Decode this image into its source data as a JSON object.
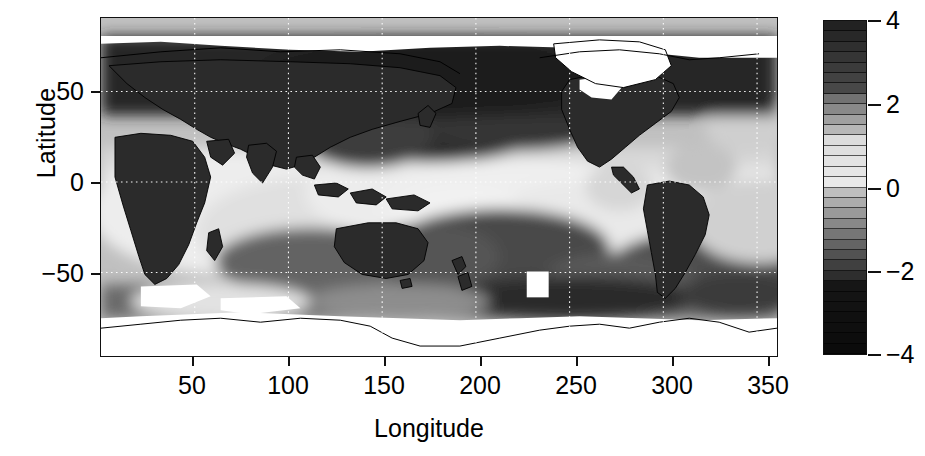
{
  "figure": {
    "type": "filled-contour-map",
    "xlabel": "Longitude",
    "ylabel": "Latitude"
  },
  "axes": {
    "x": {
      "label": "Longitude",
      "ticks": [
        50,
        100,
        150,
        200,
        250,
        300,
        350
      ],
      "tick_labels": [
        "50",
        "100",
        "150",
        "200",
        "250",
        "300",
        "350"
      ],
      "range": [
        0,
        360
      ]
    },
    "y": {
      "label": "Latitude",
      "ticks": [
        50,
        0,
        -50
      ],
      "tick_labels": [
        "50",
        "0",
        "−50"
      ],
      "range": [
        -90,
        90
      ]
    },
    "grid": "white dotted gridlines at 50 deg longitude and 50 deg latitude"
  },
  "colorbar": {
    "orientation": "vertical",
    "ticks": [
      4,
      2,
      0,
      -2,
      -4
    ],
    "tick_labels": [
      "4",
      "2",
      "0",
      "−2",
      "−4"
    ],
    "range": [
      -4,
      4
    ],
    "n_levels": 32,
    "colormap": "grayscale-diverging",
    "colors": {
      "min": "#0a0a0a",
      "mid": "#f2f2f2",
      "max": "#232323",
      "nodata": "#ffffff",
      "coastline": "#000000"
    }
  },
  "chart_data": {
    "type": "heatmap",
    "title": "",
    "xlabel": "Longitude",
    "ylabel": "Latitude",
    "xlim": [
      0,
      360
    ],
    "ylim": [
      -90,
      90
    ],
    "zlim": [
      -4,
      4
    ],
    "grid": true,
    "legend_position": "right",
    "colorbar_ticks": [
      -4,
      -2,
      0,
      2,
      4
    ],
    "x": [
      0,
      20,
      40,
      60,
      80,
      100,
      120,
      140,
      160,
      180,
      200,
      220,
      240,
      260,
      280,
      300,
      320,
      340,
      360
    ],
    "y": [
      80,
      60,
      40,
      20,
      0,
      -20,
      -40,
      -60,
      -80
    ],
    "z": [
      [
        3.6,
        3.6,
        3.7,
        3.7,
        3.7,
        3.6,
        3.5,
        3.4,
        3.2,
        2.6,
        2.4,
        2.6,
        3.0,
        3.4,
        3.5,
        3.4,
        3.2,
        3.4,
        3.6
      ],
      [
        3.5,
        3.5,
        3.6,
        3.6,
        3.6,
        3.5,
        3.4,
        3.1,
        2.2,
        1.4,
        1.6,
        2.4,
        3.1,
        3.4,
        3.4,
        3.0,
        2.2,
        3.0,
        3.5
      ],
      [
        3.3,
        3.4,
        3.5,
        3.5,
        3.5,
        3.4,
        3.2,
        2.4,
        1.3,
        1.6,
        2.8,
        3.4,
        3.4,
        3.3,
        3.2,
        2.0,
        0.9,
        2.0,
        3.3
      ],
      [
        2.6,
        2.9,
        3.3,
        3.4,
        3.4,
        2.6,
        1.2,
        0.6,
        0.7,
        1.0,
        1.6,
        2.6,
        3.2,
        3.3,
        2.8,
        1.3,
        0.8,
        1.6,
        2.6
      ],
      [
        2.5,
        3.1,
        3.4,
        1.3,
        0.6,
        0.4,
        0.6,
        1.0,
        0.2,
        0.0,
        0.3,
        0.6,
        1.1,
        1.9,
        3.2,
        1.5,
        0.8,
        1.3,
        2.5
      ],
      [
        2.4,
        3.2,
        2.6,
        0.6,
        1.1,
        1.8,
        1.9,
        2.2,
        1.6,
        0.8,
        0.4,
        0.4,
        0.8,
        1.6,
        3.3,
        2.3,
        1.4,
        1.5,
        2.4
      ],
      [
        1.4,
        1.1,
        0.8,
        0.5,
        0.9,
        1.6,
        2.2,
        2.6,
        2.1,
        1.4,
        1.2,
        1.6,
        2.2,
        2.4,
        2.8,
        2.6,
        1.0,
        0.7,
        1.4
      ],
      [
        0.8,
        0.4,
        0.3,
        0.6,
        1.4,
        2.2,
        2.6,
        2.8,
        2.6,
        2.6,
        3.0,
        3.4,
        3.5,
        3.2,
        2.6,
        2.4,
        2.8,
        1.4,
        0.8
      ],
      [
        null,
        null,
        null,
        null,
        null,
        null,
        null,
        null,
        null,
        null,
        null,
        null,
        null,
        null,
        null,
        null,
        null,
        null,
        null
      ]
    ],
    "nodata_regions": [
      "Antarctica",
      "Arctic Ocean",
      "Greenland",
      "Arctic Canada"
    ],
    "anomaly_marker": {
      "longitude": 230,
      "latitude": -55,
      "note": "white missing-data block"
    }
  }
}
